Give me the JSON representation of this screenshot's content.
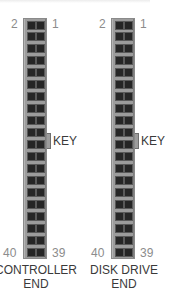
{
  "diagram": {
    "type": "IDE 40-pin ribbon connector pinout",
    "colors": {
      "connector_body": "#9c9c9c",
      "pin": "#262626",
      "pin_number_text": "#8c8c8c",
      "label_text": "#3a3a3a"
    },
    "connectors": [
      {
        "id": "controller",
        "pin_label_top_left": "2",
        "pin_label_top_right": "1",
        "pin_label_bottom_left": "40",
        "pin_label_bottom_right": "39",
        "key_label": "KEY",
        "end_label_line1": "CONTROLLER",
        "end_label_line2": "END",
        "rows": 20,
        "columns": 2
      },
      {
        "id": "disk-drive",
        "pin_label_top_left": "2",
        "pin_label_top_right": "1",
        "pin_label_bottom_left": "40",
        "pin_label_bottom_right": "39",
        "key_label": "KEY",
        "end_label_line1": "DISK DRIVE",
        "end_label_line2": "END",
        "rows": 20,
        "columns": 2
      }
    ]
  }
}
